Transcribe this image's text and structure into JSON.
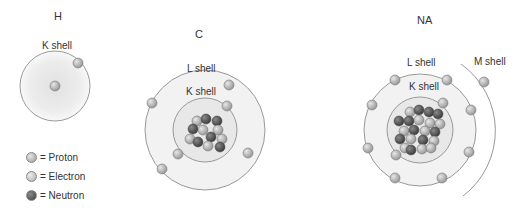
{
  "atoms": [
    {
      "symbol": "H",
      "shells": [
        "K shell"
      ],
      "electrons": 1
    },
    {
      "symbol": "C",
      "shells": [
        "L shell",
        "K shell"
      ],
      "electrons": 6
    },
    {
      "symbol": "NA",
      "shells": [
        "L shell",
        "K shell",
        "M shell"
      ],
      "electrons": 11
    }
  ],
  "labels": {
    "h_title": "H",
    "c_title": "C",
    "na_title": "NA",
    "h_k": "K shell",
    "c_l": "L shell",
    "c_k": "K shell",
    "na_l": "L shell",
    "na_k": "K shell",
    "na_m": "M shell"
  },
  "legend": [
    {
      "label": "= Proton",
      "color": "#b8b8b8"
    },
    {
      "label": "= Electron",
      "color": "#c4c4c4"
    },
    {
      "label": "= Neutron",
      "color": "#6a6a6a"
    }
  ]
}
